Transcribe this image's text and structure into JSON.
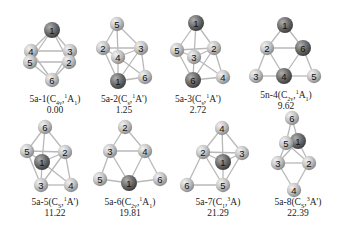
{
  "figure": {
    "colors": {
      "bond": "#b8b8b8",
      "light_atom": "#c9c9c9",
      "dark_atom": "#707070",
      "text": "#222222"
    },
    "structures": [
      {
        "id": "5a-1",
        "prefix": "5a-1(",
        "point_group": "C",
        "pg_sub": "4v",
        "spin": "1",
        "state": "A",
        "state_sub": "1",
        "suffix": ")",
        "energy": "0.00",
        "caption_pos": [
          55,
          100
        ],
        "atoms": [
          {
            "n": "1",
            "x": 52,
            "y": 30,
            "dark": true
          },
          {
            "n": "2",
            "x": 69,
            "y": 62,
            "dark": false
          },
          {
            "n": "3",
            "x": 70,
            "y": 51,
            "dark": false
          },
          {
            "n": "4",
            "x": 31,
            "y": 51,
            "dark": false
          },
          {
            "n": "5",
            "x": 30,
            "y": 62,
            "dark": false
          },
          {
            "n": "6",
            "x": 52,
            "y": 80,
            "dark": false
          }
        ],
        "bonds": [
          [
            "1",
            "2"
          ],
          [
            "1",
            "3"
          ],
          [
            "1",
            "4"
          ],
          [
            "1",
            "5"
          ],
          [
            "6",
            "2"
          ],
          [
            "6",
            "3"
          ],
          [
            "6",
            "4"
          ],
          [
            "6",
            "5"
          ],
          [
            "4",
            "3"
          ],
          [
            "5",
            "2"
          ],
          [
            "4",
            "5"
          ],
          [
            "3",
            "2"
          ]
        ]
      },
      {
        "id": "5a-2",
        "prefix": "5a-2(",
        "point_group": "C",
        "pg_sub": "s",
        "spin": "1",
        "state": "A'",
        "state_sub": "",
        "suffix": ")",
        "energy": "1.25",
        "caption_pos": [
          124,
          100
        ],
        "atoms": [
          {
            "n": "1",
            "x": 118,
            "y": 81,
            "dark": true
          },
          {
            "n": "2",
            "x": 103,
            "y": 48,
            "dark": false
          },
          {
            "n": "3",
            "x": 141,
            "y": 48,
            "dark": false
          },
          {
            "n": "4",
            "x": 118,
            "y": 57,
            "dark": false
          },
          {
            "n": "5",
            "x": 117,
            "y": 24,
            "dark": false
          },
          {
            "n": "6",
            "x": 145,
            "y": 77,
            "dark": false
          }
        ],
        "bonds": [
          [
            "5",
            "2"
          ],
          [
            "5",
            "3"
          ],
          [
            "5",
            "4"
          ],
          [
            "2",
            "3"
          ],
          [
            "2",
            "4"
          ],
          [
            "3",
            "4"
          ],
          [
            "2",
            "1"
          ],
          [
            "4",
            "1"
          ],
          [
            "3",
            "1"
          ],
          [
            "3",
            "6"
          ],
          [
            "1",
            "6"
          ],
          [
            "4",
            "6"
          ]
        ]
      },
      {
        "id": "5a-3",
        "prefix": "5a-3(",
        "point_group": "C",
        "pg_sub": "s",
        "spin": "1",
        "state": "A'",
        "state_sub": "",
        "suffix": ")",
        "energy": "2.72",
        "caption_pos": [
          198,
          100
        ],
        "atoms": [
          {
            "n": "1",
            "x": 196,
            "y": 23,
            "dark": true
          },
          {
            "n": "2",
            "x": 214,
            "y": 48,
            "dark": false
          },
          {
            "n": "3",
            "x": 194,
            "y": 57,
            "dark": false
          },
          {
            "n": "4",
            "x": 223,
            "y": 77,
            "dark": false
          },
          {
            "n": "5",
            "x": 177,
            "y": 50,
            "dark": false
          },
          {
            "n": "6",
            "x": 193,
            "y": 80,
            "dark": true
          }
        ],
        "bonds": [
          [
            "1",
            "5"
          ],
          [
            "1",
            "2"
          ],
          [
            "1",
            "3"
          ],
          [
            "5",
            "2"
          ],
          [
            "5",
            "3"
          ],
          [
            "3",
            "2"
          ],
          [
            "5",
            "6"
          ],
          [
            "3",
            "6"
          ],
          [
            "2",
            "4"
          ],
          [
            "6",
            "4"
          ],
          [
            "3",
            "4"
          ],
          [
            "2",
            "6"
          ]
        ]
      },
      {
        "id": "5n-4",
        "prefix": "5n-4(",
        "point_group": "C",
        "pg_sub": "2v",
        "spin": "1",
        "state": "A",
        "state_sub": "1",
        "suffix": ")",
        "energy": "9.62",
        "caption_pos": [
          286,
          96
        ],
        "atoms": [
          {
            "n": "1",
            "x": 285,
            "y": 25,
            "dark": true
          },
          {
            "n": "2",
            "x": 267,
            "y": 48,
            "dark": false
          },
          {
            "n": "3",
            "x": 256,
            "y": 76,
            "dark": false
          },
          {
            "n": "4",
            "x": 284,
            "y": 76,
            "dark": true
          },
          {
            "n": "5",
            "x": 314,
            "y": 76,
            "dark": false
          },
          {
            "n": "6",
            "x": 303,
            "y": 48,
            "dark": true
          }
        ],
        "bonds": [
          [
            "1",
            "2"
          ],
          [
            "1",
            "6"
          ],
          [
            "2",
            "6"
          ],
          [
            "2",
            "3"
          ],
          [
            "2",
            "4"
          ],
          [
            "6",
            "4"
          ],
          [
            "6",
            "5"
          ],
          [
            "3",
            "4"
          ],
          [
            "4",
            "5"
          ]
        ]
      },
      {
        "id": "5a-5",
        "prefix": "5a-5(",
        "point_group": "C",
        "pg_sub": "S",
        "spin": "1",
        "state": "A'",
        "state_sub": "",
        "suffix": ")",
        "energy": "11.22",
        "caption_pos": [
          55,
          203
        ],
        "atoms": [
          {
            "n": "1",
            "x": 42,
            "y": 162,
            "dark": true
          },
          {
            "n": "2",
            "x": 65,
            "y": 152,
            "dark": false
          },
          {
            "n": "3",
            "x": 41,
            "y": 185,
            "dark": false
          },
          {
            "n": "4",
            "x": 71,
            "y": 185,
            "dark": false
          },
          {
            "n": "5",
            "x": 27,
            "y": 151,
            "dark": false
          },
          {
            "n": "6",
            "x": 45,
            "y": 127,
            "dark": false
          }
        ],
        "bonds": [
          [
            "6",
            "5"
          ],
          [
            "6",
            "2"
          ],
          [
            "6",
            "1"
          ],
          [
            "5",
            "2"
          ],
          [
            "5",
            "3"
          ],
          [
            "5",
            "1"
          ],
          [
            "2",
            "1"
          ],
          [
            "2",
            "4"
          ],
          [
            "2",
            "3"
          ],
          [
            "1",
            "3"
          ],
          [
            "3",
            "4"
          ],
          [
            "1",
            "4"
          ]
        ]
      },
      {
        "id": "5a-6",
        "prefix": "5a-6(",
        "point_group": "C",
        "pg_sub": "2v",
        "spin": "1",
        "state": "A",
        "state_sub": "1",
        "suffix": ")",
        "energy": "19.81",
        "caption_pos": [
          130,
          203
        ],
        "atoms": [
          {
            "n": "1",
            "x": 129,
            "y": 183,
            "dark": true
          },
          {
            "n": "2",
            "x": 125,
            "y": 127,
            "dark": false
          },
          {
            "n": "3",
            "x": 110,
            "y": 151,
            "dark": false
          },
          {
            "n": "4",
            "x": 145,
            "y": 151,
            "dark": false
          },
          {
            "n": "5",
            "x": 100,
            "y": 179,
            "dark": false
          },
          {
            "n": "6",
            "x": 160,
            "y": 179,
            "dark": false
          }
        ],
        "bonds": [
          [
            "2",
            "3"
          ],
          [
            "2",
            "4"
          ],
          [
            "3",
            "4"
          ],
          [
            "3",
            "5"
          ],
          [
            "3",
            "1"
          ],
          [
            "4",
            "1"
          ],
          [
            "4",
            "6"
          ],
          [
            "5",
            "1"
          ],
          [
            "1",
            "6"
          ]
        ]
      },
      {
        "id": "5a-7",
        "prefix": "5a-7(",
        "point_group": "C",
        "pg_sub": "1",
        "spin": "3",
        "state": "A",
        "state_sub": "",
        "suffix": ")",
        "energy": "21.29",
        "caption_pos": [
          218,
          203
        ],
        "atoms": [
          {
            "n": "1",
            "x": 223,
            "y": 162,
            "dark": true
          },
          {
            "n": "2",
            "x": 203,
            "y": 152,
            "dark": false
          },
          {
            "n": "3",
            "x": 242,
            "y": 153,
            "dark": false
          },
          {
            "n": "4",
            "x": 222,
            "y": 128,
            "dark": false
          },
          {
            "n": "5",
            "x": 223,
            "y": 185,
            "dark": false
          },
          {
            "n": "6",
            "x": 187,
            "y": 185,
            "dark": false
          }
        ],
        "bonds": [
          [
            "4",
            "2"
          ],
          [
            "4",
            "3"
          ],
          [
            "4",
            "1"
          ],
          [
            "2",
            "3"
          ],
          [
            "2",
            "1"
          ],
          [
            "3",
            "1"
          ],
          [
            "2",
            "5"
          ],
          [
            "3",
            "5"
          ],
          [
            "1",
            "5"
          ],
          [
            "2",
            "6"
          ],
          [
            "6",
            "5"
          ]
        ]
      },
      {
        "id": "5a-8",
        "prefix": "5a-8(",
        "point_group": "C",
        "pg_sub": "S",
        "spin": "3",
        "state": "A'",
        "state_sub": "",
        "suffix": ")",
        "energy": "22.39",
        "caption_pos": [
          298,
          203
        ],
        "atoms": [
          {
            "n": "6",
            "x": 292,
            "y": 118,
            "dark": false
          },
          {
            "n": "4",
            "x": 294,
            "y": 190,
            "dark": false
          },
          {
            "n": "3",
            "x": 278,
            "y": 163,
            "dark": false
          },
          {
            "n": "2",
            "x": 309,
            "y": 163,
            "dark": false
          },
          {
            "n": "5",
            "x": 286,
            "y": 143,
            "dark": false
          },
          {
            "n": "1",
            "x": 298,
            "y": 141,
            "dark": true
          }
        ],
        "bonds": [
          [
            "6",
            "5"
          ],
          [
            "6",
            "1"
          ],
          [
            "5",
            "1"
          ],
          [
            "5",
            "3"
          ],
          [
            "5",
            "2"
          ],
          [
            "1",
            "3"
          ],
          [
            "1",
            "2"
          ],
          [
            "3",
            "2"
          ],
          [
            "3",
            "4"
          ],
          [
            "2",
            "4"
          ]
        ]
      }
    ]
  }
}
